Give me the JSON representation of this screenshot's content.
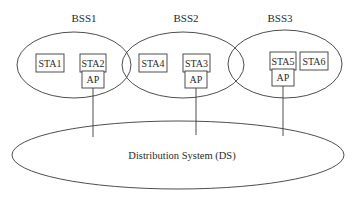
{
  "diagram": {
    "bss": [
      {
        "label": "BSS1",
        "stations": [
          "STA1",
          "STA2"
        ],
        "ap_label": "AP"
      },
      {
        "label": "BSS2",
        "stations": [
          "STA4",
          "STA3"
        ],
        "ap_label": "AP"
      },
      {
        "label": "BSS3",
        "stations": [
          "STA5",
          "STA6"
        ],
        "ap_label": "AP"
      }
    ],
    "ds_label": "Distribution System (DS)",
    "colors": {
      "stroke": "#3a3a3a",
      "text": "#2a2a2a",
      "background": "#ffffff"
    }
  }
}
